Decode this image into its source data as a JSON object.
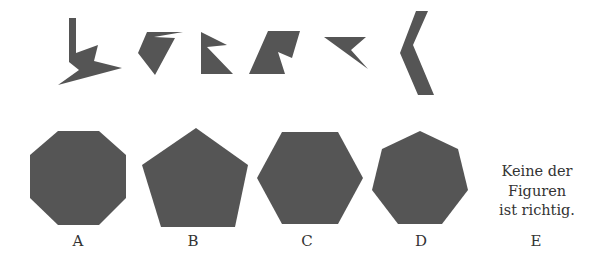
{
  "fill_color": "#555555",
  "puzzle_pieces": [
    {
      "id": "piece-1",
      "points": "69,18 76,18 76,53 98,45 94,61 122,68 58,85 79,70 69,62"
    },
    {
      "id": "piece-2",
      "points": "147,32 183,32 154,37 175,38 155,75 138,53"
    },
    {
      "id": "piece-3",
      "points": "201,32 227,45 207,47 233,74 201,74"
    },
    {
      "id": "piece-4",
      "points": "268,31 300,31 292,58 278,52 285,74 249,74"
    },
    {
      "id": "piece-5",
      "points": "324,37 366,37 351,50 368,69"
    },
    {
      "id": "piece-6",
      "points": "416,11 428,11 413,45 434,95 418,95 400,53"
    }
  ],
  "options": [
    {
      "letter": "A",
      "shape": "octagon",
      "points": "58,131 99,131 126,155 126,198 99,225 58,225 30,198 30,155",
      "label_x": 78
    },
    {
      "letter": "B",
      "shape": "pentagon",
      "points": "196,128 248,165 235,227 161,227 142,165",
      "label_x": 193
    },
    {
      "letter": "C",
      "shape": "hexagon",
      "points": "282,132 338,132 363,178 338,224 282,224 257,178",
      "label_x": 307
    },
    {
      "letter": "D",
      "shape": "heptagon",
      "points": "420,131 458,149 468,190 442,224 398,224 372,190 382,149",
      "label_x": 421
    },
    {
      "letter": "E",
      "shape": "none",
      "text_lines": [
        "Keine der",
        "Figuren",
        "ist richtig."
      ],
      "label_x": 536
    }
  ],
  "labels": {
    "a": "A",
    "b": "B",
    "c": "C",
    "d": "D",
    "e": "E"
  },
  "option_e": {
    "line1": "Keine der",
    "line2": "Figuren",
    "line3": "ist richtig."
  }
}
